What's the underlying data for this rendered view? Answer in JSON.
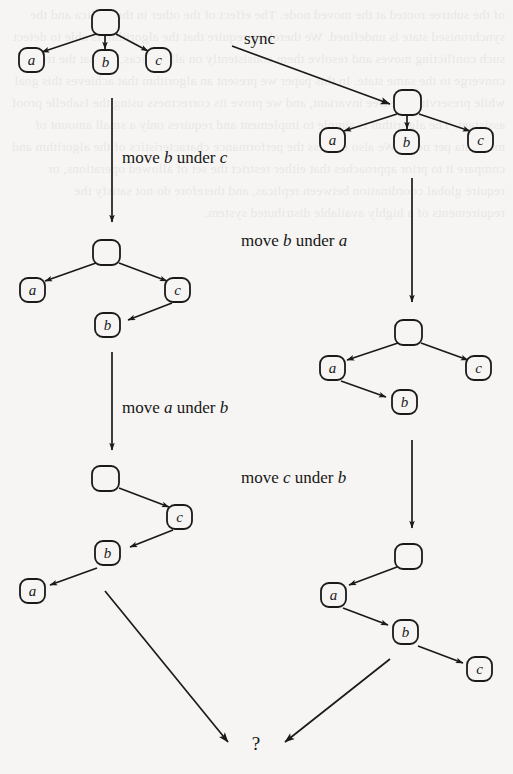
{
  "figure": {
    "title_absent": true,
    "background_color": "#f6f5f3",
    "ink_color": "#1a1a1a",
    "question_mark": "?"
  },
  "labels": {
    "sync": "sync",
    "move_b_under_c": "move b under c",
    "move_b_under_a": "move b under a",
    "move_a_under_b": "move a under b",
    "move_c_under_b": "move c under b"
  },
  "label_parts": {
    "move": "move",
    "under": "under",
    "a": "a",
    "b": "b",
    "c": "c"
  },
  "nodes": {
    "root": "",
    "a": "a",
    "b": "b",
    "c": "c"
  },
  "trees": [
    {
      "id": "tree-initial",
      "name": "initial-tree",
      "edges": [
        [
          "root",
          "a"
        ],
        [
          "root",
          "b"
        ],
        [
          "root",
          "c"
        ]
      ]
    },
    {
      "id": "tree-synced",
      "name": "synced-replica-tree",
      "edges": [
        [
          "root",
          "a"
        ],
        [
          "root",
          "b"
        ],
        [
          "root",
          "c"
        ]
      ]
    },
    {
      "id": "tree-left-mid",
      "name": "left-after-move-b-under-c",
      "edges": [
        [
          "root",
          "a"
        ],
        [
          "root",
          "c"
        ],
        [
          "c",
          "b"
        ]
      ]
    },
    {
      "id": "tree-right-mid",
      "name": "right-after-move-b-under-a",
      "edges": [
        [
          "root",
          "a"
        ],
        [
          "root",
          "c"
        ],
        [
          "a",
          "b"
        ]
      ]
    },
    {
      "id": "tree-left-bottom",
      "name": "left-after-move-a-under-b",
      "edges": [
        [
          "root",
          "c"
        ],
        [
          "c",
          "b"
        ],
        [
          "b",
          "a"
        ]
      ]
    },
    {
      "id": "tree-right-bottom",
      "name": "right-after-move-c-under-b",
      "edges": [
        [
          "root",
          "a"
        ],
        [
          "a",
          "b"
        ],
        [
          "b",
          "c"
        ]
      ]
    }
  ],
  "bleed_text": "of the subtree rooted at the moved node. The effect of the other in the replica and the synchronised state is undefined. We therefore require that the algorithm is able to detect such conflicting moves and resolve them consistently on all replicas, so that the trees converge to the same state. In this paper we present an algorithm that achieves this goal while preserving the tree invariant, and we prove its correctness using the Isabelle proof assistant. The algorithm is simple to implement and requires only a small amount of metadata per node. We also discuss the performance characteristics of the algorithm and compare it to prior approaches that either restrict the set of allowed operations, or require global coordination between replicas, and therefore do not satisfy the requirements of a highly available distributed system."
}
